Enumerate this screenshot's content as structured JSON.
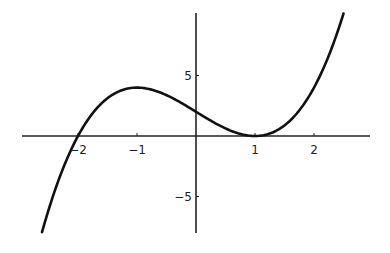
{
  "chart_data": {
    "type": "line",
    "title": "",
    "xlabel": "",
    "ylabel": "",
    "function": "x^3 - 3x + 2",
    "series": [
      {
        "name": "f(x)",
        "x": [
          -2.61,
          -2.5,
          -2.25,
          -2.0,
          -1.75,
          -1.5,
          -1.25,
          -1.0,
          -0.75,
          -0.5,
          -0.25,
          0.0,
          0.25,
          0.5,
          0.75,
          1.0,
          1.25,
          1.5,
          1.75,
          2.0,
          2.25,
          2.5
        ],
        "values": [
          -7.95,
          -6.13,
          -2.64,
          0.0,
          1.89,
          3.13,
          3.8,
          4.0,
          3.83,
          3.38,
          2.73,
          2.0,
          1.27,
          0.63,
          0.17,
          0.0,
          0.2,
          0.88,
          2.11,
          4.0,
          6.64,
          10.13
        ]
      }
    ],
    "xticks": [
      -2,
      -1,
      1,
      2
    ],
    "xtick_labels": [
      "-2",
      "-1",
      "1",
      "2"
    ],
    "yticks": [
      5,
      -5
    ],
    "ytick_labels": [
      "5",
      "-5"
    ],
    "xlim": [
      -2.95,
      2.95
    ],
    "ylim": [
      -8,
      10.2
    ],
    "grid": false,
    "legend": null,
    "axes_style": "cross-at-origin",
    "line_color": "#111111"
  }
}
